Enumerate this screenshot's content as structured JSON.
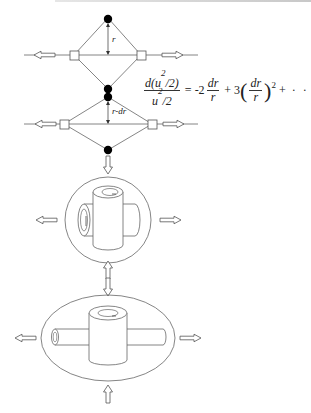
{
  "diagram": {
    "colors": {
      "stroke": "#555555",
      "node_fill": "#000000",
      "background": "#ffffff"
    },
    "top_diamond": {
      "radius_label": "r"
    },
    "bottom_diamond": {
      "radius_label": "r-dr"
    },
    "equation": {
      "lhs_numerator": "d(u",
      "lhs_numerator_sup": "2",
      "lhs_numerator_tail": "/2)",
      "lhs_denominator": "u",
      "lhs_denominator_sup": "2",
      "lhs_denominator_tail": "/2",
      "equals": "=",
      "term1_coef": "-2",
      "term1_num": "dr",
      "term1_den": "r",
      "plus1": "+",
      "term2_coef": "3",
      "term2_num": "dr",
      "term2_den": "r",
      "term2_power": "2",
      "plus2": "+",
      "ellipsis": "· · ·"
    },
    "panels": [
      {
        "name": "sphere-with-vortex-tubes",
        "shape": "circle"
      },
      {
        "name": "stretched-ellipsoid-with-vortex-tubes",
        "shape": "ellipse"
      }
    ]
  }
}
